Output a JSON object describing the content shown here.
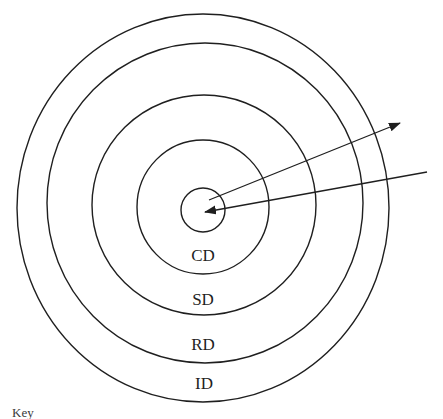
{
  "diagram": {
    "type": "concentric-circles",
    "rings": [
      {
        "name": "center-circle",
        "label": ""
      },
      {
        "name": "ring-cd",
        "label": "CD"
      },
      {
        "name": "ring-sd",
        "label": "SD"
      },
      {
        "name": "ring-rd",
        "label": "RD"
      },
      {
        "name": "ring-id",
        "label": "ID"
      }
    ],
    "key_label": "Key",
    "arrows": [
      {
        "name": "outward-arrow",
        "direction": "center-to-upper-right"
      },
      {
        "name": "inward-arrow",
        "direction": "right-edge-to-center"
      }
    ],
    "colors": {
      "line": "#1f1f1f",
      "background": "#ffffff"
    }
  }
}
